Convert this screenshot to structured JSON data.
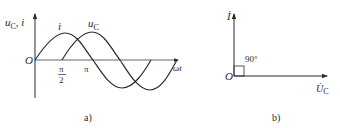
{
  "panel_a": {
    "caption": "a)",
    "y_axis_label_main": "u",
    "y_axis_label_sub": "C",
    "y_axis_label_rest": ", i",
    "x_axis_label": "ωt",
    "origin_label": "O",
    "tick_pi_half_num": "π",
    "tick_pi_half_den": "2",
    "tick_pi": "π",
    "curve_i_label": "i",
    "curve_uc_label_main": "u",
    "curve_uc_label_sub": "C"
  },
  "panel_b": {
    "caption": "b)",
    "vertical_phasor_label": "İ",
    "horizontal_phasor_main": "U̇",
    "horizontal_phasor_sub": "C",
    "origin_label": "O",
    "angle_label": "90°"
  },
  "colors": {
    "line": "#2a2a2a",
    "axis": "#555555",
    "background": "#ffffff"
  }
}
